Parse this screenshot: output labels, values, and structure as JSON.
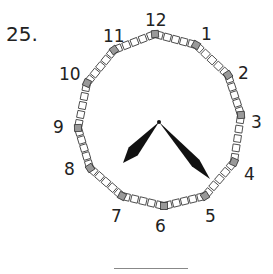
{
  "question": {
    "number": "25."
  },
  "clock": {
    "center": [
      159,
      122
    ],
    "hour_labels": [
      "12",
      "1",
      "2",
      "3",
      "4",
      "5",
      "6",
      "7",
      "8",
      "9",
      "10",
      "11"
    ],
    "vertices": [
      [
        155,
        34
      ],
      [
        196,
        45
      ],
      [
        228,
        75
      ],
      [
        241,
        115
      ],
      [
        234,
        162
      ],
      [
        205,
        196
      ],
      [
        164,
        206
      ],
      [
        122,
        196
      ],
      [
        90,
        168
      ],
      [
        78,
        128
      ],
      [
        87,
        83
      ],
      [
        114,
        50
      ]
    ],
    "label_positions": [
      [
        145,
        26
      ],
      [
        201,
        40
      ],
      [
        238,
        79
      ],
      [
        251,
        128
      ],
      [
        244,
        180
      ],
      [
        205,
        222
      ],
      [
        155,
        232
      ],
      [
        111,
        222
      ],
      [
        64,
        175
      ],
      [
        53,
        133
      ],
      [
        59,
        80
      ],
      [
        103,
        42
      ]
    ],
    "minor_ticks_per_segment": 4,
    "colors": {
      "hour_tick": "#999999",
      "minor_tick": "#ffffff",
      "tick_border": "#333333",
      "hands": "#111111"
    },
    "hands": {
      "hour_hand_tip": [
        123,
        163
      ],
      "minute_hand_tip": [
        210,
        179
      ]
    }
  },
  "answer": {
    "blank": ""
  }
}
